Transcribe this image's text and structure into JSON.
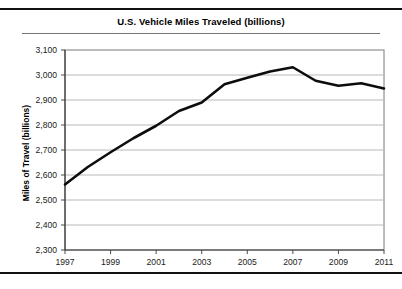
{
  "figure": {
    "title": "U.S. Vehicle Miles Traveled (billions)",
    "background_color": "#ffffff",
    "rule_color": "#111111"
  },
  "chart_data": {
    "type": "line",
    "title": "U.S. Vehicle Miles Traveled (billions)",
    "xlabel": "",
    "ylabel": "Miles of Travel (billions)",
    "xlim": [
      1997,
      2011
    ],
    "ylim": [
      2300,
      3100
    ],
    "grid": true,
    "legend": "none",
    "line_color": "#0d0d0d",
    "x": [
      1997,
      1998,
      1999,
      2000,
      2001,
      2002,
      2003,
      2004,
      2005,
      2006,
      2007,
      2008,
      2009,
      2010,
      2011
    ],
    "values": [
      2562,
      2632,
      2691,
      2747,
      2797,
      2856,
      2890,
      2963,
      2989,
      3014,
      3031,
      2977,
      2957,
      2967,
      2946
    ],
    "series": [
      {
        "name": "U.S. Vehicle Miles Traveled",
        "values": [
          2562,
          2632,
          2691,
          2747,
          2797,
          2856,
          2890,
          2963,
          2989,
          3014,
          3031,
          2977,
          2957,
          2967,
          2946
        ]
      }
    ],
    "y_ticks": [
      2300,
      2400,
      2500,
      2600,
      2700,
      2800,
      2900,
      3000,
      3100
    ],
    "y_tick_labels": [
      "2,300",
      "2,400",
      "2,500",
      "2,600",
      "2,700",
      "2,800",
      "2,900",
      "3,000",
      "3,100"
    ],
    "x_ticks": [
      1997,
      1999,
      2001,
      2003,
      2005,
      2007,
      2009,
      2011
    ],
    "x_tick_labels": [
      "1997",
      "1999",
      "2001",
      "2003",
      "2005",
      "2007",
      "2009",
      "2011"
    ]
  }
}
